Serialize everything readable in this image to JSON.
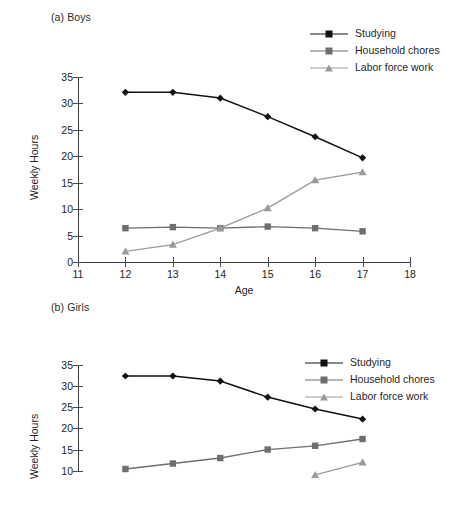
{
  "figure": {
    "panels": [
      {
        "id": "boys",
        "title": "(a) Boys",
        "legend_position": "top-right"
      },
      {
        "id": "girls",
        "title": "(b) Girls",
        "legend_position": "top-right"
      }
    ]
  },
  "axis": {
    "ylabel": "Weekly Hours",
    "xlabel": "Age",
    "y_ticks": [
      "0",
      "5",
      "10",
      "15",
      "20",
      "25",
      "30",
      "35"
    ],
    "x_ticks": [
      "11",
      "12",
      "13",
      "14",
      "15",
      "16",
      "17",
      "18"
    ]
  },
  "legend": {
    "items": [
      {
        "label": "Studying",
        "marker": "diamond-marker",
        "color": "#111111"
      },
      {
        "label": "Household chores",
        "marker": "square-marker",
        "color": "#6e6e6e"
      },
      {
        "label": "Labor force work",
        "marker": "triangle-marker",
        "color": "#9a9a9a"
      }
    ]
  },
  "chart_data": [
    {
      "type": "line",
      "title": "(a) Boys",
      "xlabel": "Age",
      "ylabel": "Weekly Hours",
      "xlim": [
        11,
        18
      ],
      "ylim": [
        0,
        35
      ],
      "x": [
        12,
        13,
        14,
        15,
        16,
        17
      ],
      "grid": false,
      "legend_position": "top-right",
      "series": [
        {
          "name": "Studying",
          "values": [
            32.1,
            32.1,
            31.0,
            27.5,
            23.7,
            19.7
          ],
          "color": "#111111",
          "marker": "diamond"
        },
        {
          "name": "Household chores",
          "values": [
            6.4,
            6.6,
            6.4,
            6.7,
            6.4,
            5.8
          ],
          "color": "#6e6e6e",
          "marker": "square"
        },
        {
          "name": "Labor force work",
          "values": [
            2.0,
            3.3,
            6.4,
            10.2,
            15.5,
            17.0
          ],
          "color": "#9a9a9a",
          "marker": "triangle"
        }
      ]
    },
    {
      "type": "line",
      "title": "(b) Girls",
      "xlabel": "Age",
      "ylabel": "Weekly Hours",
      "xlim": [
        11,
        18
      ],
      "ylim": [
        0,
        35
      ],
      "x": [
        12,
        13,
        14,
        15,
        16,
        17
      ],
      "grid": false,
      "legend_position": "top-right",
      "note": "Lower portion of this panel is cropped by the screenshot edge",
      "series": [
        {
          "name": "Studying",
          "values": [
            32.4,
            32.4,
            31.2,
            27.4,
            24.6,
            22.2
          ],
          "color": "#111111",
          "marker": "diamond"
        },
        {
          "name": "Household chores",
          "values": [
            10.4,
            11.7,
            13.0,
            15.0,
            15.9,
            17.5
          ],
          "color": "#6e6e6e",
          "marker": "square"
        },
        {
          "name": "Labor force work",
          "values": [
            null,
            null,
            null,
            null,
            9.0,
            12.0
          ],
          "color": "#9a9a9a",
          "marker": "triangle"
        }
      ]
    }
  ]
}
